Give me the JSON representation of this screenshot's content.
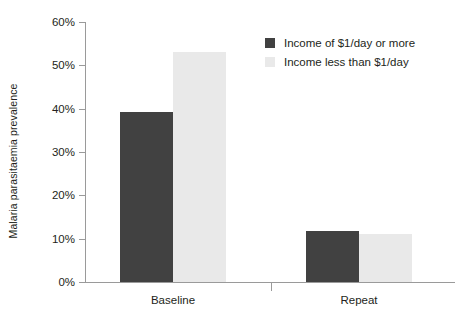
{
  "chart_data": {
    "type": "bar",
    "title": "",
    "xlabel": "",
    "ylabel": "Malaria parasitaemia prevalence",
    "categories": [
      "Baseline",
      "Repeat"
    ],
    "series": [
      {
        "name": "Income of $1/day or more",
        "color": "#414141",
        "values": [
          39.3,
          11.8
        ]
      },
      {
        "name": "Income less than $1/day",
        "color": "#e9e9e9",
        "values": [
          53.0,
          11.0
        ]
      }
    ],
    "ylim": [
      0,
      60
    ],
    "ytick_values": [
      0,
      10,
      20,
      30,
      40,
      50,
      60
    ],
    "ytick_labels": [
      "0%",
      "10%",
      "20%",
      "30%",
      "40%",
      "50%",
      "60%"
    ],
    "grid": false,
    "legend_position": "top-right"
  },
  "axis": {
    "line_color": "#9a9a9a"
  }
}
